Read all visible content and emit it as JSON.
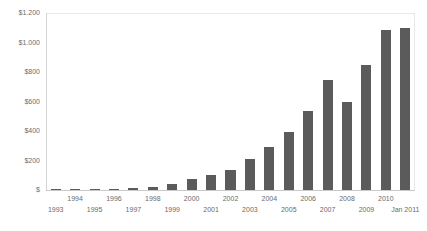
{
  "chart_data": {
    "type": "bar",
    "title": "",
    "xlabel": "",
    "ylabel": "",
    "ylim": [
      0,
      1200
    ],
    "grid": false,
    "legend": "none",
    "bar_color": "#5b5b5b",
    "axis_text_color": "#6b6b6b",
    "y_ticks": [
      "$",
      "$200",
      "$400",
      "$600",
      "$800",
      "$1.000",
      "$1.200"
    ],
    "y_tick_values": [
      0,
      200,
      400,
      600,
      800,
      1000,
      1200
    ],
    "categories": [
      "1993",
      "1994",
      "1995",
      "1996",
      "1997",
      "1998",
      "1999",
      "2000",
      "2001",
      "2002",
      "2003",
      "2004",
      "2005",
      "2006",
      "2007",
      "2008",
      "2009",
      "2010",
      "Jan 2011"
    ],
    "values": [
      2,
      3,
      5,
      8,
      12,
      20,
      40,
      75,
      105,
      135,
      210,
      290,
      395,
      535,
      745,
      600,
      850,
      1085,
      1100
    ]
  }
}
